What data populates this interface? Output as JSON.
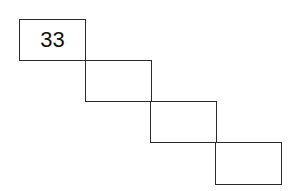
{
  "diagram": {
    "cells": [
      {
        "label": "33"
      },
      {
        "label": ""
      },
      {
        "label": ""
      },
      {
        "label": ""
      }
    ],
    "line_color": "#2a2a2a"
  }
}
